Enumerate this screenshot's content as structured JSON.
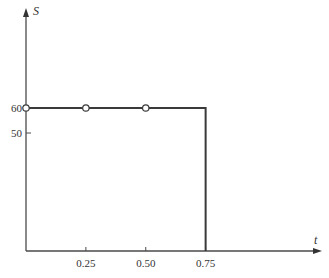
{
  "chart_data": {
    "type": "line",
    "title": "",
    "xlabel": "t",
    "ylabel": "S",
    "x_ticks": [
      {
        "value": 0.25,
        "label": "0.25"
      },
      {
        "value": 0.5,
        "label": "0.50"
      },
      {
        "value": 0.75,
        "label": "0.75"
      }
    ],
    "y_ticks": [
      {
        "value": 50,
        "label": "50"
      },
      {
        "value": 60,
        "label": "60"
      }
    ],
    "series": [
      {
        "name": "S(t)",
        "description": "Step function: S = 60 for 0 <= t <= 0.75, then drops vertically to 0 at t = 0.75",
        "points": [
          {
            "x": 0,
            "y": 60
          },
          {
            "x": 0.75,
            "y": 60
          },
          {
            "x": 0.75,
            "y": 0
          }
        ],
        "open_markers": [
          {
            "x": 0,
            "y": 60
          },
          {
            "x": 0.25,
            "y": 60
          },
          {
            "x": 0.5,
            "y": 60
          }
        ]
      }
    ],
    "xlim": [
      0,
      0.95
    ],
    "ylim": [
      0,
      96
    ],
    "grid": false,
    "legend": "none",
    "colors": {
      "axis": "#4a4a4a",
      "line": "#3a3a3a",
      "marker_fill": "#ffffff"
    }
  }
}
